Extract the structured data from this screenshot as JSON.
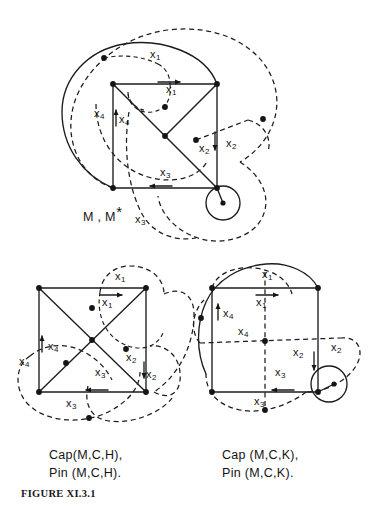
{
  "figure": {
    "number_label": "FIGURE XI.3.1",
    "background_color": "#ffffff",
    "ink_color": "#1c1c1c"
  },
  "diagrams": [
    {
      "id": "top",
      "caption": "M , M",
      "caption_star": "*",
      "description": "square with both diagonals, large solid enclosing arc, dashed generator curves and small circle at lower right vertex",
      "labels": [
        {
          "name": "x1-dashed",
          "base": "x",
          "sub": "1",
          "x": 155,
          "y": 55
        },
        {
          "name": "x1-edge",
          "base": "x",
          "sub": "1",
          "x": 172,
          "y": 90
        },
        {
          "name": "x4-dashed",
          "base": "x",
          "sub": "4",
          "x": 97,
          "y": 113
        },
        {
          "name": "x4-edge",
          "base": "x",
          "sub": "4",
          "x": 120,
          "y": 118
        },
        {
          "name": "x2-dashed",
          "base": "x",
          "sub": "2",
          "x": 202,
          "y": 145
        },
        {
          "name": "x2-edge",
          "base": "x",
          "sub": "2",
          "x": 229,
          "y": 140
        },
        {
          "name": "x3-edge",
          "base": "x",
          "sub": "3",
          "x": 163,
          "y": 172
        },
        {
          "name": "x3-dashed",
          "base": "x",
          "sub": "3",
          "x": 138,
          "y": 218
        }
      ]
    },
    {
      "id": "bottom-left",
      "caption_line1": "Cap(M,C,H),",
      "caption_line2": "Pin (M,C,H).",
      "description": "square with both diagonals and dashed generator curves",
      "labels": [
        {
          "name": "x1-dashed",
          "base": "x",
          "sub": "1",
          "x": 118,
          "y": 276
        },
        {
          "name": "x1-edge",
          "base": "x",
          "sub": "1",
          "x": 105,
          "y": 300
        },
        {
          "name": "x4-edge",
          "base": "x",
          "sub": "4",
          "x": 50,
          "y": 345
        },
        {
          "name": "x4-dashed",
          "base": "x",
          "sub": "4",
          "x": 22,
          "y": 360
        },
        {
          "name": "x2-dashed",
          "base": "x",
          "sub": "2",
          "x": 128,
          "y": 355
        },
        {
          "name": "x2-edge",
          "base": "x",
          "sub": "2",
          "x": 148,
          "y": 372
        },
        {
          "name": "x3-edge",
          "base": "x",
          "sub": "3",
          "x": 98,
          "y": 372
        },
        {
          "name": "x3-dashed",
          "base": "x",
          "sub": "3",
          "x": 69,
          "y": 402
        }
      ]
    },
    {
      "id": "bottom-right",
      "caption_line1": "Cap (M,C,K),",
      "caption_line2": "Pin (M,C,K).",
      "description": "square with dashed vertical and horizontal midlines, small circle at lower right vertex",
      "labels": [
        {
          "name": "x1-dashed",
          "base": "x",
          "sub": "1",
          "x": 265,
          "y": 273
        },
        {
          "name": "x1-edge",
          "base": "x",
          "sub": "1",
          "x": 259,
          "y": 301
        },
        {
          "name": "x4-edge",
          "base": "x",
          "sub": "4",
          "x": 226,
          "y": 312
        },
        {
          "name": "x4-dashed",
          "base": "x",
          "sub": "4",
          "x": 240,
          "y": 330
        },
        {
          "name": "x2-edge",
          "base": "x",
          "sub": "2",
          "x": 296,
          "y": 350
        },
        {
          "name": "x2-dashed",
          "base": "x",
          "sub": "2",
          "x": 334,
          "y": 345
        },
        {
          "name": "x3-edge",
          "base": "x",
          "sub": "3",
          "x": 278,
          "y": 372
        },
        {
          "name": "x3-dashed",
          "base": "x",
          "sub": "3",
          "x": 257,
          "y": 400
        }
      ]
    }
  ],
  "captions": {
    "top_main": "M , M",
    "top_star": "*",
    "bottom_left_line1": "Cap(M,C,H),",
    "bottom_left_line2": "Pin (M,C,H).",
    "bottom_right_line1": "Cap (M,C,K),",
    "bottom_right_line2": "Pin (M,C,K)."
  }
}
